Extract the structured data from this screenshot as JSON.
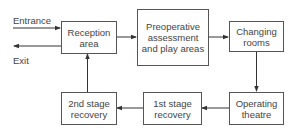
{
  "diagram": {
    "type": "flowchart",
    "external": {
      "entrance_label": "Entrance",
      "exit_label": "Exit"
    },
    "nodes": [
      {
        "id": "reception",
        "label": "Reception area"
      },
      {
        "id": "preop",
        "label": "Preoperative assessment and play areas"
      },
      {
        "id": "changing",
        "label": "Changing rooms"
      },
      {
        "id": "theatre",
        "label": "Operating theatre"
      },
      {
        "id": "recovery1",
        "label": "1st stage recovery"
      },
      {
        "id": "recovery2",
        "label": "2nd stage recovery"
      }
    ],
    "edges": [
      {
        "from": "Entrance",
        "to": "reception"
      },
      {
        "from": "reception",
        "to": "Exit"
      },
      {
        "from": "reception",
        "to": "preop"
      },
      {
        "from": "preop",
        "to": "changing"
      },
      {
        "from": "changing",
        "to": "theatre"
      },
      {
        "from": "theatre",
        "to": "recovery1"
      },
      {
        "from": "recovery1",
        "to": "recovery2"
      },
      {
        "from": "recovery2",
        "to": "reception"
      }
    ],
    "colors": {
      "line": "#333333",
      "box_border": "#555555",
      "text": "#444444"
    }
  }
}
